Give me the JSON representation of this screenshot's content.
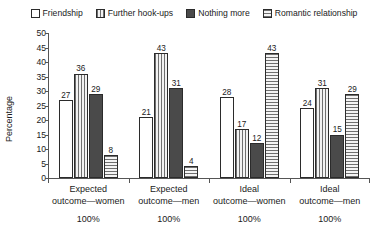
{
  "chart_data": {
    "type": "bar",
    "title": "",
    "xlabel": "",
    "ylabel": "Percentage",
    "ylim": [
      0,
      50
    ],
    "yticks": [
      0,
      5,
      10,
      15,
      20,
      25,
      30,
      35,
      40,
      45,
      50
    ],
    "grid": false,
    "legend_position": "top",
    "categories": [
      "Expected outcome—women",
      "Expected outcome—men",
      "Ideal outcome—women",
      "Ideal outcome—men"
    ],
    "category_lines": [
      [
        "Expected",
        "outcome—women"
      ],
      [
        "Expected",
        "outcome—men"
      ],
      [
        "Ideal",
        "outcome—women"
      ],
      [
        "Ideal",
        "outcome—men"
      ]
    ],
    "category_totals": [
      "100%",
      "100%",
      "100%",
      "100%"
    ],
    "series": [
      {
        "name": "Friendship",
        "pattern": "plain",
        "values": [
          27,
          21,
          28,
          24
        ]
      },
      {
        "name": "Further hook-ups",
        "pattern": "vertical-lines",
        "values": [
          36,
          43,
          17,
          31
        ]
      },
      {
        "name": "Nothing more",
        "pattern": "solid-dark",
        "values": [
          29,
          31,
          12,
          15
        ]
      },
      {
        "name": "Romantic relationship",
        "pattern": "horizontal-lines",
        "values": [
          8,
          4,
          43,
          29
        ]
      }
    ]
  },
  "colors": {
    "axis": "#555555",
    "text": "#1a1a1a",
    "bar_outline": "#2b2b2b",
    "solid_dark": "#4a4a4a",
    "pattern_light": "#e9e9e9",
    "background": "#ffffff"
  }
}
